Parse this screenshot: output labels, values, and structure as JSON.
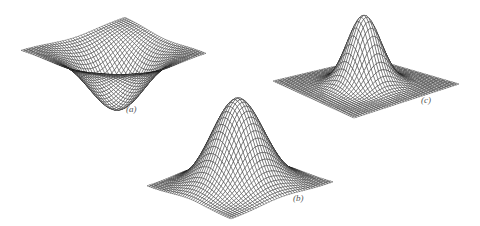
{
  "figure": {
    "background": "#ffffff",
    "mesh_color": "#1a1a1a",
    "panels": [
      {
        "id": "a",
        "label": "(a)",
        "label_pos": [
          129,
          110
        ],
        "shape": "inverted-gaussian",
        "left": [
          21,
          50
        ],
        "front": [
          116,
          78
        ],
        "right": [
          206,
          53
        ],
        "back": [
          125,
          17
        ],
        "height": -60,
        "sigma": 0.22,
        "grid": 40
      },
      {
        "id": "b",
        "label": "(b)",
        "label_pos": [
          296,
          199
        ],
        "shape": "gaussian",
        "left": [
          147,
          186
        ],
        "front": [
          231,
          219
        ],
        "right": [
          333,
          182
        ],
        "back": [
          240,
          158
        ],
        "height": -88,
        "sigma": 0.2,
        "grid": 40
      },
      {
        "id": "c",
        "label": "(c)",
        "label_pos": [
          424,
          101
        ],
        "shape": "gaussian",
        "left": [
          273,
          81
        ],
        "front": [
          354,
          118
        ],
        "right": [
          459,
          84
        ],
        "back": [
          370,
          58
        ],
        "height": -70,
        "sigma": 0.13,
        "grid": 40
      }
    ]
  }
}
